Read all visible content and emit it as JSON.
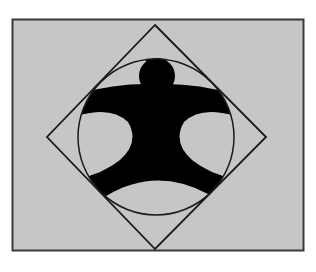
{
  "figure": {
    "colors": {
      "background": "#ffffff",
      "panel_fill": "#c6c6c6",
      "panel_border": "#3a3a3a",
      "line": "#1a1a1a",
      "figure_fill": "#000000"
    },
    "shapes": [
      "rectangle",
      "diamond",
      "circle",
      "human-figure"
    ]
  }
}
